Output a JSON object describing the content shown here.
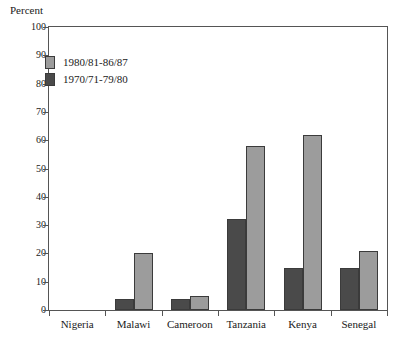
{
  "chart_data": {
    "type": "bar",
    "title": "",
    "subtitle": "",
    "xlabel": "",
    "ylabel": "Percent",
    "ylim": [
      0,
      100
    ],
    "yticks": [
      0,
      10,
      20,
      30,
      40,
      50,
      60,
      70,
      80,
      90,
      100
    ],
    "grid": false,
    "legend_position": "inside-upper-left",
    "categories": [
      "Nigeria",
      "Malawi",
      "Cameroon",
      "Tanzania",
      "Kenya",
      "Senegal"
    ],
    "series": [
      {
        "name": "1970/71-79/80",
        "color": "#4a4a4a",
        "values": [
          0,
          4,
          4,
          32,
          15,
          15
        ]
      },
      {
        "name": "1980/81-86/87",
        "color": "#9c9c9c",
        "values": [
          0,
          20,
          5,
          58,
          62,
          21
        ]
      }
    ]
  },
  "axis": {
    "y_title": "Percent",
    "y_tick_labels": [
      "100",
      "90",
      "80",
      "70",
      "60",
      "50",
      "40",
      "30",
      "20",
      "10",
      "0"
    ],
    "x_tick_labels": [
      "Nigeria",
      "Malawi",
      "Cameroon",
      "Tanzania",
      "Kenya",
      "Senegal"
    ]
  },
  "legend": {
    "entries": [
      {
        "label": "1980/81-86/87",
        "swatch": "light"
      },
      {
        "label": "1970/71-79/80",
        "swatch": "dark"
      }
    ]
  },
  "colors": {
    "series_recent": "#9c9c9c",
    "series_earlier": "#4a4a4a",
    "axis": "#555555",
    "text": "#1a1a1a",
    "background": "#ffffff"
  }
}
